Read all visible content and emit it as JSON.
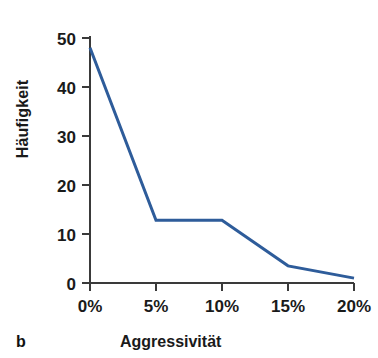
{
  "figure": {
    "panel_letter": "b",
    "background_color": "#ffffff"
  },
  "chart_data": {
    "type": "line",
    "title": "",
    "subtitle": "",
    "xlabel": "Aggressivität",
    "ylabel": "Häufigkeit",
    "x_tick_labels": [
      "0%",
      "5%",
      "10%",
      "15%",
      "20%"
    ],
    "x_tick_values": [
      0,
      5,
      10,
      15,
      20
    ],
    "y_tick_labels": [
      "0",
      "10",
      "20",
      "30",
      "40",
      "50"
    ],
    "y_tick_values": [
      0,
      10,
      20,
      30,
      40,
      50
    ],
    "xlim": [
      0,
      20
    ],
    "ylim": [
      0,
      50
    ],
    "grid": false,
    "legend": false,
    "legend_position": "none",
    "x": [
      0,
      5,
      10,
      15,
      20
    ],
    "values": [
      48,
      12.8,
      12.8,
      3.5,
      1
    ],
    "series": [
      {
        "name": "Häufigkeit",
        "values": [
          48,
          12.8,
          12.8,
          3.5,
          1
        ],
        "color": "#2e5c9a",
        "line_width": 3,
        "markers": false
      }
    ],
    "axis_color": "#3a3a3a",
    "text_color": "#1a1a1a",
    "annotations": []
  }
}
